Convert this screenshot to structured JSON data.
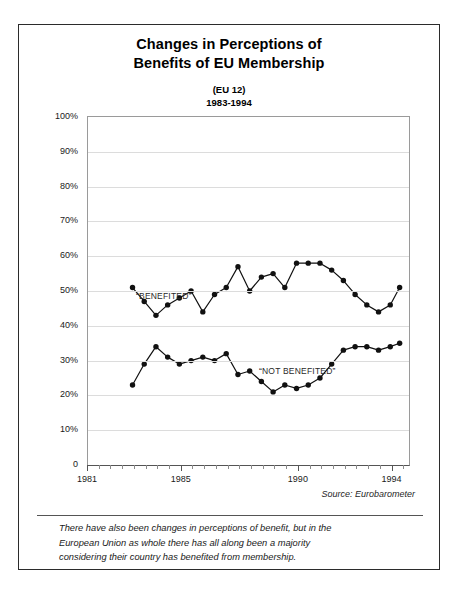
{
  "figure": {
    "title_lines": [
      "Changes in Perceptions of",
      "Benefits of EU Membership"
    ],
    "subtitle_lines": [
      "(EU 12)",
      "1983-1994"
    ],
    "source_note": "Source: Eurobarometer",
    "caption_lines": [
      "There have also been changes in perceptions of benefit, but in the",
      "European Union as whole there has all along been a majority",
      "considering their country has benefited from membership."
    ]
  },
  "chart_data": {
    "type": "line",
    "title": "Changes in Perceptions of Benefits of EU Membership",
    "subtitle": "(EU 12) 1983-1994",
    "xlabel": "",
    "ylabel": "",
    "xlim": [
      1981,
      1994.7
    ],
    "ylim": [
      0,
      100
    ],
    "grid": true,
    "legend_position": "inline-annotation",
    "y_ticks": [
      0,
      10,
      20,
      30,
      40,
      50,
      60,
      70,
      80,
      90,
      100
    ],
    "y_tick_labels": [
      "0",
      "10%",
      "20%",
      "30%",
      "40%",
      "50%",
      "60%",
      "70%",
      "80%",
      "90%",
      "100%"
    ],
    "x_ticks": [
      1981,
      1985,
      1990,
      1994
    ],
    "x_tick_labels": [
      "1981",
      "1985",
      "1990",
      "1994"
    ],
    "x_minor_tick_interval": 0.5,
    "series": [
      {
        "name": "“BENEFITED”",
        "color": "#111111",
        "x": [
          1982.9,
          1983.4,
          1983.9,
          1984.4,
          1984.9,
          1985.4,
          1985.9,
          1986.4,
          1986.9,
          1987.4,
          1987.9,
          1988.4,
          1988.9,
          1989.4,
          1989.9,
          1990.4,
          1990.9,
          1991.4,
          1991.9,
          1992.4,
          1992.9,
          1993.4,
          1993.9,
          1994.3
        ],
        "values": [
          51,
          47,
          43,
          46,
          48,
          50,
          44,
          49,
          51,
          57,
          50,
          54,
          55,
          51,
          58,
          58,
          58,
          56,
          53,
          49,
          46,
          44,
          46,
          51
        ]
      },
      {
        "name": "“NOT BENEFITED”",
        "color": "#111111",
        "x": [
          1982.9,
          1983.4,
          1983.9,
          1984.4,
          1984.9,
          1985.4,
          1985.9,
          1986.4,
          1986.9,
          1987.4,
          1987.9,
          1988.4,
          1988.9,
          1989.4,
          1989.9,
          1990.4,
          1990.9,
          1991.4,
          1991.9,
          1992.4,
          1992.9,
          1993.4,
          1993.9,
          1994.3
        ],
        "values": [
          23,
          29,
          34,
          31,
          29,
          30,
          31,
          30,
          32,
          26,
          27,
          24,
          21,
          23,
          22,
          23,
          25,
          29,
          33,
          34,
          34,
          33,
          34,
          35
        ]
      }
    ],
    "annotations": [
      {
        "text": "“BENEFITED”",
        "x": 1983.6,
        "y": 54
      },
      {
        "text": "“NOT BENEFITED”",
        "x": 1988.7,
        "y": 36
      }
    ]
  }
}
